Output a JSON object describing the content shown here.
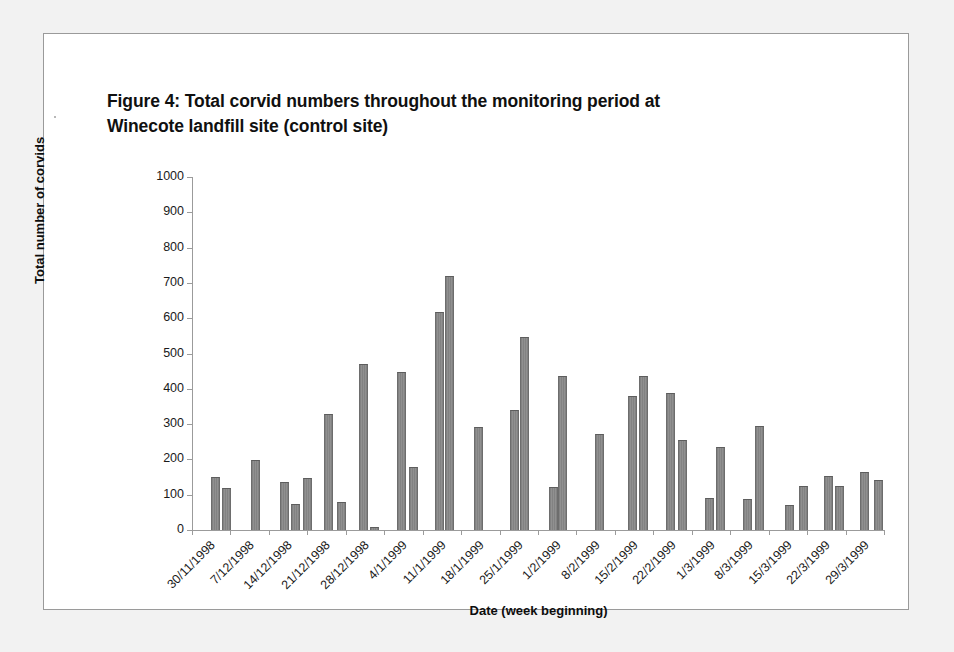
{
  "figure": {
    "title_line1": "Figure 4: Total corvid numbers throughout the monitoring period at",
    "title_line2": "Winecote landfill site (control site)"
  },
  "chart_data": {
    "type": "bar",
    "title": "Figure 4: Total corvid numbers throughout the monitoring period at Winecote landfill site (control site)",
    "xlabel": "Date (week beginning)",
    "ylabel": "Total number of corvids",
    "ylim": [
      0,
      1000
    ],
    "ytick_step": 100,
    "yticks": [
      "0",
      "100",
      "200",
      "300",
      "400",
      "500",
      "600",
      "700",
      "800",
      "900",
      "1000"
    ],
    "grid": false,
    "legend": "none",
    "bar_color": "#8a8a8a",
    "categories": [
      "30/11/1998",
      "7/12/1998",
      "14/12/1998",
      "21/12/1998",
      "28/12/1998",
      "4/1/1999",
      "11/1/1999",
      "18/1/1999",
      "25/1/1999",
      "1/2/1999",
      "8/2/1999",
      "15/2/1999",
      "22/2/1999",
      "1/3/1999",
      "8/3/1999",
      "15/3/1999",
      "22/3/1999",
      "29/3/1999"
    ],
    "bars": [
      {
        "x": 0.1,
        "value": 150
      },
      {
        "x": 0.4,
        "value": 119
      },
      {
        "x": 1.15,
        "value": 197
      },
      {
        "x": 1.9,
        "value": 137
      },
      {
        "x": 2.2,
        "value": 74
      },
      {
        "x": 2.5,
        "value": 147
      },
      {
        "x": 3.05,
        "value": 330
      },
      {
        "x": 3.4,
        "value": 80
      },
      {
        "x": 3.95,
        "value": 471
      },
      {
        "x": 4.25,
        "value": 8
      },
      {
        "x": 4.95,
        "value": 447
      },
      {
        "x": 5.25,
        "value": 178
      },
      {
        "x": 5.95,
        "value": 617
      },
      {
        "x": 6.2,
        "value": 720
      },
      {
        "x": 6.95,
        "value": 293
      },
      {
        "x": 7.9,
        "value": 339
      },
      {
        "x": 8.15,
        "value": 547
      },
      {
        "x": 8.9,
        "value": 123
      },
      {
        "x": 9.15,
        "value": 435
      },
      {
        "x": 10.1,
        "value": 271
      },
      {
        "x": 10.95,
        "value": 379
      },
      {
        "x": 11.25,
        "value": 437
      },
      {
        "x": 11.95,
        "value": 389
      },
      {
        "x": 12.25,
        "value": 254
      },
      {
        "x": 12.95,
        "value": 92
      },
      {
        "x": 13.25,
        "value": 236
      },
      {
        "x": 13.95,
        "value": 88
      },
      {
        "x": 14.25,
        "value": 294
      },
      {
        "x": 15.05,
        "value": 72
      },
      {
        "x": 15.4,
        "value": 126
      },
      {
        "x": 16.05,
        "value": 152
      },
      {
        "x": 16.35,
        "value": 124
      },
      {
        "x": 17.0,
        "value": 163
      },
      {
        "x": 17.35,
        "value": 141
      }
    ]
  }
}
